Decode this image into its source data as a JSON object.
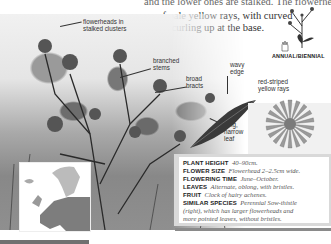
{
  "page": {
    "cut_text_left": "and habitats",
    "intro_lines": [
      "and the lower ones are stalked. The flowerheads are made",
      "up of pale yellow rays, with curved",
      "bracts curling up at the base."
    ]
  },
  "annotations": {
    "flowerheads": [
      "flowerheads in",
      "stalked clusters"
    ],
    "stems": [
      "branched",
      "stems"
    ],
    "bracts": [
      "broad",
      "bracts"
    ],
    "edge": [
      "wavy",
      "edge"
    ],
    "leaf": [
      "long,",
      "narrow",
      "leaf"
    ],
    "rays": [
      "red-striped",
      "yellow rays"
    ]
  },
  "lifecycle": "ANNUAL/BIENNIAL",
  "facts": [
    {
      "label": "PLANT HEIGHT",
      "value": "40–90cm."
    },
    {
      "label": "FLOWER SIZE",
      "value": "Flowerhead 2–2.5cm wide."
    },
    {
      "label": "FLOWERING TIME",
      "value": "June–October."
    },
    {
      "label": "LEAVES",
      "value": "Alternate, oblong, with bristles."
    },
    {
      "label": "FRUIT",
      "value": "Clock of hairy achenes."
    },
    {
      "label": "SIMILAR SPECIES",
      "value": "Perennial Sow-thistle"
    },
    {
      "label": "",
      "value": "(right), which has larger flowerheads and"
    },
    {
      "label": "",
      "value": "more pointed leaves, without bristles."
    }
  ],
  "icons": {
    "map": "europe-distribution-map",
    "sketch": "plant-silhouette-icon",
    "hand": "hand-scale-icon"
  }
}
